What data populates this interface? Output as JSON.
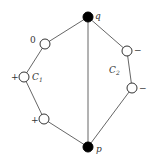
{
  "diagram": {
    "nodes": [
      {
        "id": "q",
        "label": "q",
        "type": "filled",
        "x": 88,
        "y": 17
      },
      {
        "id": "p",
        "label": "p",
        "type": "filled",
        "x": 88,
        "y": 147
      },
      {
        "id": "c1a",
        "sign": "0",
        "type": "open",
        "x": 45,
        "y": 44
      },
      {
        "id": "c1b",
        "sign": "+",
        "type": "open",
        "x": 24,
        "y": 77
      },
      {
        "id": "c1c",
        "sign": "+",
        "type": "open",
        "x": 44,
        "y": 119
      },
      {
        "id": "c2a",
        "sign": "−",
        "type": "open",
        "x": 127,
        "y": 51
      },
      {
        "id": "c2b",
        "sign": "−",
        "type": "open",
        "x": 132,
        "y": 88
      }
    ],
    "edges": [
      [
        "q",
        "c1a"
      ],
      [
        "c1a",
        "c1b"
      ],
      [
        "c1b",
        "c1c"
      ],
      [
        "c1c",
        "p"
      ],
      [
        "q",
        "p"
      ],
      [
        "q",
        "c2a"
      ],
      [
        "c2a",
        "c2b"
      ],
      [
        "c2b",
        "p"
      ]
    ],
    "labels": {
      "q": "q",
      "p": "p",
      "c1_main": "C",
      "c1_sub": "1",
      "c2_main": "C",
      "c2_sub": "2",
      "sign_c1a": "0",
      "sign_c1b": "+",
      "sign_c1c": "+",
      "sign_c2a": "−",
      "sign_c2b": "−"
    }
  }
}
